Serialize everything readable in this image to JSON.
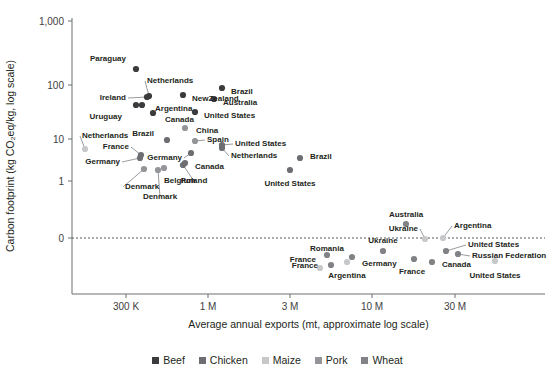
{
  "chart_data": {
    "type": "scatter",
    "title": "",
    "xlabel": "Average annual exports (mt, approximate log scale)",
    "ylabel": "Carbon footprint (kg CO₂eq/kg, log scale)",
    "grid": false,
    "legend_position": "bottom",
    "x_tick_labels": [
      "300 K",
      "1 M",
      "3 M",
      "10 M",
      "30 M"
    ],
    "x_tick_px": [
      126,
      208,
      290,
      372,
      455
    ],
    "y_tick_labels": [
      "1,000",
      "100",
      "10",
      "1",
      "0"
    ],
    "y_tick_px": [
      21,
      85,
      139,
      181,
      238
    ],
    "zero_reference_line": 0,
    "series": [
      {
        "name": "Beef",
        "color": "#3b3b3d",
        "points": [
          {
            "label": "Paraguay",
            "px": 136,
            "py": 69,
            "lx": 128,
            "ly": 58,
            "anchor": "end",
            "leader": false
          },
          {
            "label": "Netherlands",
            "px": 149,
            "py": 96,
            "lx": 145,
            "ly": 80,
            "anchor": "start",
            "leader": true
          },
          {
            "label": "NewZealand",
            "px": 183,
            "py": 95,
            "lx": 190,
            "ly": 98,
            "anchor": "start",
            "leader": false
          },
          {
            "label": "Ireland",
            "px": 147,
            "py": 97,
            "lx": 128,
            "ly": 97,
            "anchor": "end",
            "leader": true
          },
          {
            "label": "Argentina",
            "px": 142,
            "py": 105,
            "lx": 153,
            "ly": 108,
            "anchor": "start",
            "leader": false
          },
          {
            "label": "Uruguay",
            "px": 136,
            "py": 105,
            "lx": 124,
            "ly": 116,
            "anchor": "end",
            "leader": false
          },
          {
            "label": "Canada",
            "px": 153,
            "py": 113,
            "lx": 163,
            "ly": 119,
            "anchor": "start",
            "leader": false
          },
          {
            "label": "Brazil",
            "px": 222,
            "py": 88,
            "lx": 229,
            "ly": 91,
            "anchor": "start",
            "leader": false
          },
          {
            "label": "Australia",
            "px": 214,
            "py": 99,
            "lx": 221,
            "ly": 102,
            "anchor": "start",
            "leader": false
          },
          {
            "label": "United States",
            "px": 195,
            "py": 112,
            "lx": 202,
            "ly": 115,
            "anchor": "start",
            "leader": false
          }
        ]
      },
      {
        "name": "Chicken",
        "color": "#6d6e71",
        "points": [
          {
            "label": "Brazil",
            "px": 167,
            "py": 140,
            "lx": 156,
            "ly": 133,
            "anchor": "end",
            "leader": false
          },
          {
            "label": "Germany",
            "px": 191,
            "py": 153,
            "lx": 184,
            "ly": 157,
            "anchor": "end",
            "leader": true
          },
          {
            "label": "Netherlands",
            "px": 222,
            "py": 148,
            "lx": 229,
            "ly": 155,
            "anchor": "start",
            "leader": true
          },
          {
            "label": "United States",
            "px": 222,
            "py": 145,
            "lx": 233,
            "ly": 143,
            "anchor": "start",
            "leader": true
          },
          {
            "label": "Poland",
            "px": 183,
            "py": 165,
            "lx": 194,
            "ly": 180,
            "anchor": "middle",
            "leader": true
          },
          {
            "label": "Canada",
            "px": 185,
            "py": 163,
            "lx": 193,
            "ly": 166,
            "anchor": "start",
            "leader": false
          },
          {
            "label": "France",
            "px": 141,
            "py": 155,
            "lx": 131,
            "ly": 146,
            "anchor": "end",
            "leader": true
          },
          {
            "label": "Germany",
            "px": 140,
            "py": 158,
            "lx": 122,
            "ly": 161,
            "anchor": "end",
            "leader": true
          },
          {
            "label": "Brazil",
            "px": 300,
            "py": 158,
            "lx": 308,
            "ly": 156,
            "anchor": "start",
            "leader": false
          },
          {
            "label": "United States",
            "px": 290,
            "py": 170,
            "lx": 290,
            "ly": 183,
            "anchor": "middle",
            "leader": false
          }
        ]
      },
      {
        "name": "Maize",
        "color": "#c7c8ca",
        "points": [
          {
            "label": "Netherlands",
            "px": 85,
            "py": 149,
            "lx": 80,
            "ly": 135,
            "anchor": "start",
            "leader": true
          },
          {
            "label": "Argentina",
            "px": 347,
            "py": 262,
            "lx": 347,
            "ly": 275,
            "anchor": "middle",
            "leader": false
          },
          {
            "label": "France",
            "px": 320,
            "py": 268,
            "lx": 318,
            "ly": 259,
            "anchor": "end",
            "leader": false
          },
          {
            "label": "United States",
            "px": 495,
            "py": 261,
            "lx": 495,
            "ly": 275,
            "anchor": "middle",
            "leader": false
          },
          {
            "label": "Ukraine",
            "px": 425,
            "py": 239,
            "lx": 420,
            "ly": 228,
            "anchor": "end",
            "leader": true
          },
          {
            "label": "Argentina",
            "px": 443,
            "py": 238,
            "lx": 452,
            "ly": 225,
            "anchor": "start",
            "leader": true
          }
        ]
      },
      {
        "name": "Pork",
        "color": "#939598",
        "points": [
          {
            "label": "Denmark",
            "px": 144,
            "py": 169,
            "lx": 123,
            "ly": 186,
            "anchor": "start",
            "leader": true
          },
          {
            "label": "Denmark",
            "px": 158,
            "py": 170,
            "lx": 160,
            "ly": 196,
            "anchor": "middle",
            "leader": true
          },
          {
            "label": "Belgium",
            "px": 164,
            "py": 168,
            "lx": 162,
            "ly": 180,
            "anchor": "start",
            "leader": false
          },
          {
            "label": "Spain",
            "px": 195,
            "py": 141,
            "lx": 205,
            "ly": 139,
            "anchor": "start",
            "leader": true
          },
          {
            "label": "China",
            "px": 185,
            "py": 128,
            "lx": 194,
            "ly": 130,
            "anchor": "start",
            "leader": false
          }
        ]
      },
      {
        "name": "Wheat",
        "color": "#808285",
        "points": [
          {
            "label": "Australia",
            "px": 406,
            "py": 224,
            "lx": 406,
            "ly": 214,
            "anchor": "middle",
            "leader": false
          },
          {
            "label": "Ukraine",
            "px": 383,
            "py": 251,
            "lx": 383,
            "ly": 240,
            "anchor": "middle",
            "leader": false
          },
          {
            "label": "Romania",
            "px": 327,
            "py": 255,
            "lx": 327,
            "ly": 248,
            "anchor": "middle",
            "leader": false
          },
          {
            "label": "France",
            "px": 331,
            "py": 265,
            "lx": 320,
            "ly": 265,
            "anchor": "end",
            "leader": false
          },
          {
            "label": "Germany",
            "px": 352,
            "py": 257,
            "lx": 360,
            "ly": 263,
            "anchor": "start",
            "leader": false
          },
          {
            "label": "France",
            "px": 414,
            "py": 259,
            "lx": 412,
            "ly": 271,
            "anchor": "middle",
            "leader": false
          },
          {
            "label": "Canada",
            "px": 432,
            "py": 262,
            "lx": 440,
            "ly": 264,
            "anchor": "start",
            "leader": false
          },
          {
            "label": "United States",
            "px": 446,
            "py": 251,
            "lx": 466,
            "ly": 244,
            "anchor": "start",
            "leader": true
          },
          {
            "label": "Russian Federation",
            "px": 458,
            "py": 254,
            "lx": 470,
            "ly": 255,
            "anchor": "start",
            "leader": true
          }
        ]
      }
    ],
    "legend": [
      {
        "label": "Beef",
        "color": "#3b3b3d"
      },
      {
        "label": "Chicken",
        "color": "#6d6e71"
      },
      {
        "label": "Maize",
        "color": "#c7c8ca"
      },
      {
        "label": "Pork",
        "color": "#939598"
      },
      {
        "label": "Wheat",
        "color": "#808285"
      }
    ],
    "axes_geometry": {
      "x_axis_y": 294,
      "y_axis_x": 72,
      "y_axis_top": 18,
      "plot_right": 545,
      "zero_line_y": 238
    }
  }
}
